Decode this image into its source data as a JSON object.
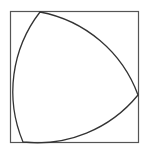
{
  "diagram": {
    "colors": {
      "background": "#ffffff",
      "square_stroke": "#555555",
      "curve_stroke": "#333333"
    },
    "square": {
      "x": 10.5,
      "y": 11.5,
      "width": 128,
      "height": 131
    },
    "vertices": {
      "top": [
        40,
        12
      ],
      "right": [
        138,
        95
      ],
      "bottom_left": [
        23,
        142
      ]
    }
  }
}
